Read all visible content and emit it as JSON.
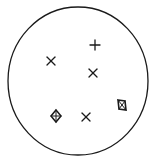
{
  "diagram": {
    "background": "#ffffff",
    "stroke_color": "#1a1a1a",
    "boundary": {
      "shape": "circle",
      "cx": 78,
      "cy": 81,
      "rx": 70,
      "ry": 74
    },
    "symbols": [
      {
        "type": "plus",
        "x": 95,
        "y": 45,
        "label": "plus-mark"
      },
      {
        "type": "cross",
        "x": 51,
        "y": 61,
        "label": "x-mark"
      },
      {
        "type": "cross",
        "x": 93,
        "y": 73,
        "label": "x-mark"
      },
      {
        "type": "diamond-cross",
        "x": 56,
        "y": 116,
        "label": "diamond-with-cross"
      },
      {
        "type": "cross",
        "x": 86,
        "y": 117,
        "label": "x-mark"
      },
      {
        "type": "box-cross",
        "x": 122,
        "y": 105,
        "label": "box-with-x"
      }
    ]
  }
}
